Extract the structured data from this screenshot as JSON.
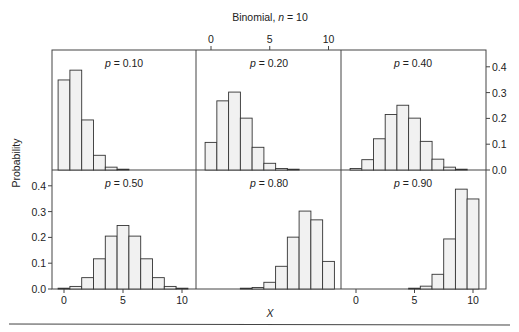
{
  "chart_data": {
    "type": "bar",
    "title": "Binomial, n = 10",
    "title_parts": {
      "prefix": "Binomial, ",
      "var": "n",
      "suffix": " = 10"
    },
    "xlabel": "X",
    "ylabel": "Probability",
    "x_ticks": [
      0,
      5,
      10
    ],
    "x_tick_labels": [
      "0",
      "5",
      "10"
    ],
    "y_ticks": [
      0.0,
      0.1,
      0.2,
      0.3,
      0.4
    ],
    "y_tick_labels": [
      "0.0",
      "0.1",
      "0.2",
      "0.3",
      "0.4"
    ],
    "ylim": [
      0,
      0.45
    ],
    "xlim": [
      -1,
      11
    ],
    "grid": false,
    "categories": [
      0,
      1,
      2,
      3,
      4,
      5,
      6,
      7,
      8,
      9,
      10
    ],
    "panels": [
      {
        "label": "p = 0.10",
        "p_value": "0.10",
        "row": 0,
        "col": 0,
        "values": [
          0.349,
          0.387,
          0.194,
          0.057,
          0.011,
          0.001,
          0.0,
          0.0,
          0.0,
          0.0,
          0.0
        ]
      },
      {
        "label": "p = 0.20",
        "p_value": "0.20",
        "row": 0,
        "col": 1,
        "values": [
          0.107,
          0.268,
          0.302,
          0.201,
          0.088,
          0.026,
          0.006,
          0.001,
          0.0,
          0.0,
          0.0
        ]
      },
      {
        "label": "p = 0.40",
        "p_value": "0.40",
        "row": 0,
        "col": 2,
        "values": [
          0.006,
          0.04,
          0.121,
          0.215,
          0.251,
          0.201,
          0.111,
          0.042,
          0.011,
          0.002,
          0.0
        ]
      },
      {
        "label": "p = 0.50",
        "p_value": "0.50",
        "row": 1,
        "col": 0,
        "values": [
          0.001,
          0.01,
          0.044,
          0.117,
          0.205,
          0.246,
          0.205,
          0.117,
          0.044,
          0.01,
          0.001
        ]
      },
      {
        "label": "p = 0.80",
        "p_value": "0.80",
        "row": 1,
        "col": 1,
        "values": [
          0.0,
          0.0,
          0.0,
          0.001,
          0.006,
          0.026,
          0.088,
          0.201,
          0.302,
          0.268,
          0.107
        ]
      },
      {
        "label": "p = 0.90",
        "p_value": "0.90",
        "row": 1,
        "col": 2,
        "values": [
          0.0,
          0.0,
          0.0,
          0.0,
          0.0,
          0.001,
          0.011,
          0.057,
          0.194,
          0.387,
          0.349
        ]
      }
    ],
    "axes_placement": {
      "top_x_axis": "middle column (top row)",
      "bottom_x_axis": "left and right columns (bottom row)",
      "right_y_axis": "right column (top row)",
      "left_y_axis": "left column (bottom row)"
    }
  },
  "colors": {
    "bar_fill": "#f1f1f1",
    "bar_stroke": "#333333",
    "frame": "#444444",
    "text": "#222222"
  }
}
